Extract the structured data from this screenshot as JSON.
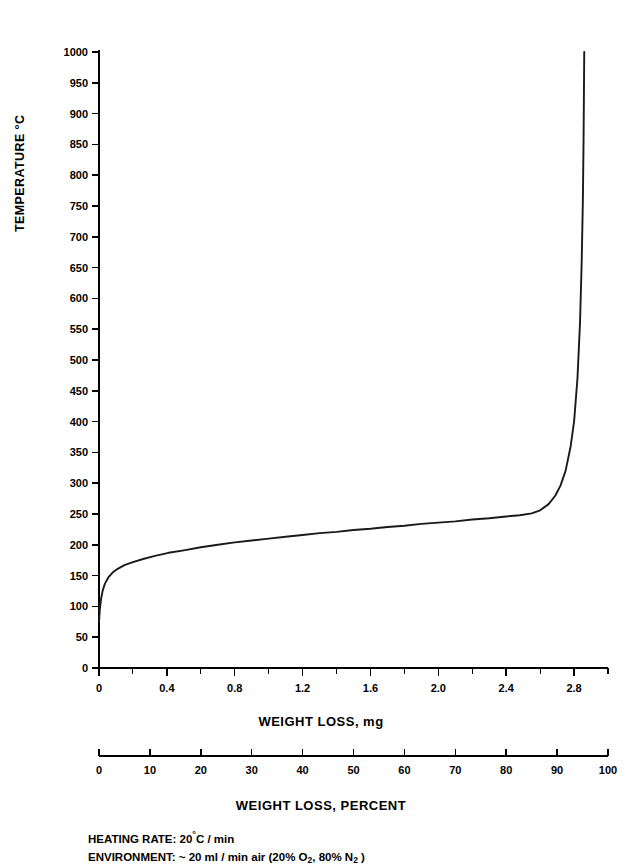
{
  "chart_data": {
    "type": "line",
    "title": "",
    "xlabel": "WEIGHT LOSS, mg",
    "ylabel": "TEMPERATURE °C",
    "xlim": [
      0,
      3.0
    ],
    "ylim": [
      0,
      1000
    ],
    "grid": false,
    "legend": null,
    "x_ticks": [
      0,
      0.4,
      0.8,
      1.2,
      1.6,
      2.0,
      2.4,
      2.8
    ],
    "x_tick_labels": [
      "0",
      "0.4",
      "0.8",
      "1.2",
      "1.6",
      "2.0",
      "2.4",
      "2.8"
    ],
    "x_minor_step": 0.2,
    "y_ticks": [
      0,
      50,
      100,
      150,
      200,
      250,
      300,
      350,
      400,
      450,
      500,
      550,
      600,
      650,
      700,
      750,
      800,
      850,
      900,
      950,
      1000
    ],
    "y_tick_labels": [
      "0",
      "50",
      "100",
      "150",
      "200",
      "250",
      "300",
      "350",
      "400",
      "450",
      "500",
      "550",
      "600",
      "650",
      "700",
      "750",
      "800",
      "850",
      "900",
      "950",
      "1000"
    ],
    "secondary_axis": {
      "label": "WEIGHT LOSS, PERCENT",
      "lim": [
        0,
        100
      ],
      "ticks": [
        0,
        10,
        20,
        30,
        40,
        50,
        60,
        70,
        80,
        90,
        100
      ],
      "tick_labels": [
        "0",
        "10",
        "20",
        "30",
        "40",
        "50",
        "60",
        "70",
        "80",
        "90",
        "100"
      ]
    },
    "series": [
      {
        "name": "TGA weight loss curve",
        "x": [
          0.0,
          0.005,
          0.012,
          0.022,
          0.035,
          0.055,
          0.08,
          0.11,
          0.15,
          0.2,
          0.26,
          0.33,
          0.41,
          0.5,
          0.6,
          0.7,
          0.8,
          0.9,
          1.0,
          1.1,
          1.2,
          1.3,
          1.4,
          1.5,
          1.6,
          1.7,
          1.8,
          1.9,
          2.0,
          2.1,
          2.2,
          2.3,
          2.4,
          2.48,
          2.55,
          2.6,
          2.65,
          2.69,
          2.72,
          2.75,
          2.78,
          2.8,
          2.82,
          2.835,
          2.845,
          2.852,
          2.856,
          2.858,
          2.86
        ],
        "y": [
          75,
          95,
          112,
          126,
          137,
          147,
          155,
          161,
          167,
          172,
          177,
          182,
          187,
          191,
          196,
          200,
          204,
          207,
          210,
          213,
          216,
          219,
          221,
          224,
          226,
          229,
          231,
          234,
          236,
          238,
          241,
          243,
          246,
          248,
          251,
          256,
          266,
          280,
          296,
          320,
          360,
          400,
          470,
          560,
          660,
          760,
          860,
          930,
          1000
        ]
      }
    ]
  },
  "notes": {
    "heating_rate_prefix": "HEATING RATE: 20",
    "heating_rate_suffix": "C / min",
    "environment_prefix": "ENVIRONMENT: ~ 20 ml / min air (20% O",
    "environment_mid": ", 80% N",
    "environment_suffix": " )",
    "o2_sub": "2",
    "n2_sub": "2"
  }
}
